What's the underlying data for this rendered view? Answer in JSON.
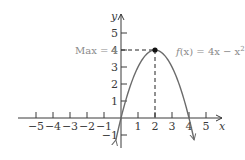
{
  "chart_data": {
    "type": "line",
    "title": "",
    "function_label": "f(x) = 4x − x²",
    "function_label_parts": {
      "f": "f",
      "rest": "(x) = 4x − x",
      "sup": "2"
    },
    "xlabel": "x",
    "ylabel": "y",
    "xlim": [
      -5.5,
      5.5
    ],
    "ylim": [
      -1.5,
      5.5
    ],
    "x_ticks": [
      -5,
      -4,
      -3,
      -2,
      -1,
      1,
      2,
      3,
      4,
      5
    ],
    "x_tick_labels": [
      "−5",
      "−4",
      "−3",
      "−2",
      "−1",
      "1",
      "2",
      "3",
      "4",
      "5"
    ],
    "y_ticks": [
      -1,
      1,
      2,
      3,
      4,
      5
    ],
    "y_tick_labels": [
      "−1",
      "1",
      "2",
      "3",
      "4",
      "5"
    ],
    "grid": false,
    "series": [
      {
        "name": "f(x) = 4x − x²",
        "x": [
          -0.3,
          0,
          0.5,
          1,
          1.5,
          2,
          2.5,
          3,
          3.5,
          4,
          4.3
        ],
        "y": [
          -1.29,
          0,
          1.75,
          3,
          3.75,
          4,
          3.75,
          3,
          1.75,
          0,
          -1.29
        ]
      }
    ],
    "annotations": [
      {
        "type": "point",
        "x": 2,
        "y": 4,
        "label": "vertex"
      },
      {
        "type": "dashed-line",
        "from": [
          0,
          4
        ],
        "to": [
          2,
          4
        ]
      },
      {
        "type": "dashed-line",
        "from": [
          2,
          4
        ],
        "to": [
          2,
          0
        ]
      },
      {
        "type": "text",
        "text": "Max = 4",
        "at": [
          0,
          4
        ]
      }
    ],
    "max_label": "Max = 4"
  },
  "colors": {
    "axis": "#3a3a3a",
    "curve": "#6b6b6b",
    "annotation_text": "#8a8a8a",
    "point": "#111111"
  }
}
